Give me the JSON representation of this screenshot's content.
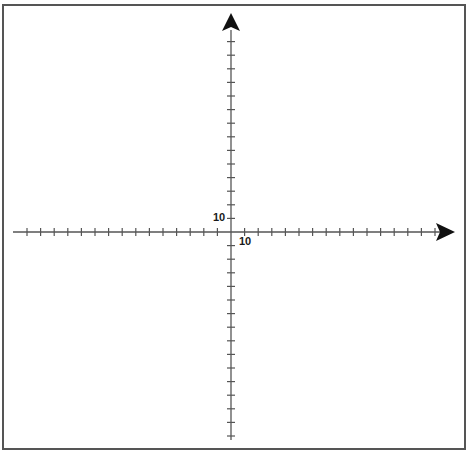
{
  "diagram": {
    "type": "coordinate-plane",
    "axes": {
      "x": {
        "label_value": "10",
        "arrow": "right",
        "tick_spacing_px": 13.6,
        "ticks_negative": 15,
        "ticks_positive": 15
      },
      "y": {
        "label_value": "10",
        "arrow": "up",
        "tick_spacing_px": 13.6,
        "ticks_negative": 15,
        "ticks_positive": 15
      }
    },
    "colors": {
      "axis": "#555555",
      "arrow": "#111111",
      "frame": "#555555",
      "background": "#ffffff"
    }
  }
}
